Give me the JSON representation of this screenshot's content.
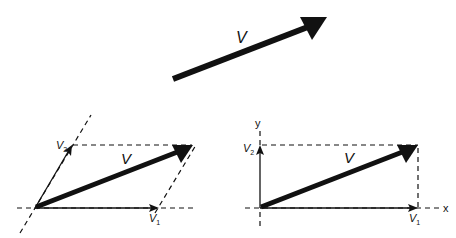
{
  "colors": {
    "ink": "#111111",
    "background": "#ffffff"
  },
  "top": {
    "vector_label": "V"
  },
  "left": {
    "vector_label": "V",
    "component1_label": "V",
    "component1_sub": "1",
    "component2_label": "V",
    "component2_sub": "2",
    "description": "Oblique (non-orthogonal) decomposition of V into components along skewed axes"
  },
  "right": {
    "vector_label": "V",
    "component1_label": "V",
    "component1_sub": "1",
    "component2_label": "V",
    "component2_sub": "2",
    "x_axis_label": "x",
    "y_axis_label": "y",
    "description": "Orthogonal decomposition of V into x and y components"
  }
}
